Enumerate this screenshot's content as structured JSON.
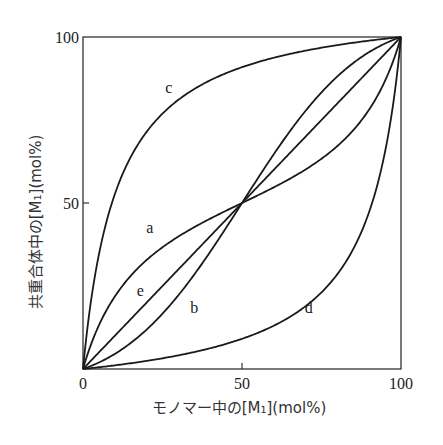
{
  "chart_data": {
    "type": "line",
    "title": "",
    "xlabel": "モノマー中の[M₁](mol%)",
    "ylabel": "共重合体中の[M₁](mol%)",
    "xlim": [
      0,
      100
    ],
    "ylim": [
      0,
      100
    ],
    "xticks": [
      "0",
      "50",
      "100"
    ],
    "yticks": [
      "0",
      "50",
      "100"
    ],
    "grid": false,
    "legend": "none (curves labeled inline)",
    "series": [
      {
        "name": "a",
        "r1": 0.3,
        "r2": 0.3,
        "label_pos": [
          21,
          41
        ],
        "x": [
          0,
          10,
          20,
          30,
          40,
          50,
          60,
          70,
          80,
          90,
          100
        ],
        "y": [
          0,
          21,
          33,
          41,
          46,
          50,
          54,
          59,
          67,
          79,
          100
        ]
      },
      {
        "name": "b",
        "r1": 3,
        "r2": 3,
        "label_pos": [
          35,
          17
        ],
        "x": [
          0,
          10,
          20,
          30,
          40,
          50,
          60,
          70,
          80,
          90,
          100
        ],
        "y": [
          0,
          4,
          8,
          16,
          31,
          50,
          69,
          84,
          92,
          96,
          100
        ]
      },
      {
        "name": "c",
        "r1": 10,
        "r2": 0.1,
        "label_pos": [
          27,
          83
        ],
        "x": [
          0,
          8,
          10,
          20,
          30,
          40,
          50,
          60,
          70,
          80,
          90,
          100
        ],
        "y": [
          0,
          47,
          53,
          71,
          80,
          87,
          91,
          94,
          96,
          98,
          99,
          100
        ]
      },
      {
        "name": "d",
        "r1": 0.1,
        "r2": 10,
        "label_pos": [
          71,
          17
        ],
        "x": [
          0,
          10,
          20,
          30,
          40,
          50,
          60,
          70,
          80,
          90,
          100
        ],
        "y": [
          0,
          1,
          2,
          4,
          6,
          9,
          13,
          20,
          29,
          47,
          100
        ]
      },
      {
        "name": "e",
        "r1": 1,
        "r2": 1,
        "label_pos": [
          18,
          22
        ],
        "x": [
          0,
          50,
          100
        ],
        "y": [
          0,
          50,
          100
        ]
      }
    ]
  }
}
